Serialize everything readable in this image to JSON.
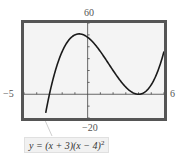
{
  "chart_data": {
    "type": "line",
    "title": "",
    "function": "y = (x+3)(x-4)^2",
    "xlabel": "",
    "ylabel": "",
    "xlim": [
      -5,
      6
    ],
    "ylim": [
      -20,
      60
    ],
    "x_tick_spacing": 1,
    "y_tick_spacing": 10,
    "grid": false,
    "window_labels": {
      "xmin": "−5",
      "xmax": "6",
      "ymin": "−20",
      "ymax": "60"
    },
    "series": [
      {
        "name": "y = (x + 3)(x − 4)²",
        "x": [
          -3.3,
          -3,
          -2.5,
          -2,
          -1.5,
          -1,
          -0.667,
          0,
          0.5,
          1,
          1.5,
          2,
          2.5,
          3,
          3.5,
          4,
          4.5,
          5,
          5.5,
          6
        ],
        "values": [
          -15.1,
          0,
          21.1,
          36,
          45.4,
          50,
          50.8,
          48,
          42.9,
          36,
          28.1,
          20,
          12.4,
          6,
          1.6,
          0,
          1.9,
          8,
          19.1,
          36
        ]
      }
    ],
    "annotations": [
      {
        "text": "y = (x + 3)(x − 4)²",
        "points_to": "curve near x = −3.3"
      }
    ]
  },
  "labels": {
    "ymax": "60",
    "ymin": "−20",
    "xmin": "−5",
    "xmax": "6",
    "equation_main": "y = (x + 3)(x − 4)",
    "equation_exp": "2"
  },
  "colors": {
    "frame": "#555555",
    "screen_bg": "#f4f4f4",
    "curve": "#1a1a1a",
    "axis": "#444444"
  }
}
